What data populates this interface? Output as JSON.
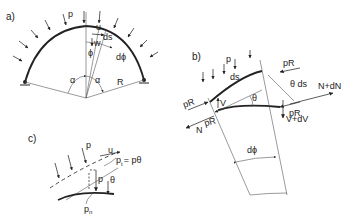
{
  "figure": {
    "panel_a": {
      "label": "a)",
      "load": "p",
      "tangential_disp": "u",
      "radial_disp": "w",
      "element": "ds",
      "angle_phi": "ϕ",
      "angle_dphi": "dϕ",
      "half_angle_left": "α",
      "half_angle_right": "α",
      "radius": "R"
    },
    "panel_b": {
      "label": "b)",
      "load": "p",
      "element": "ds",
      "force_pR_top_right": "pR",
      "force_pR_left_upper": "pR",
      "force_pR_left_lower": "pR",
      "force_pR_right": "pR",
      "theta_ds": "θ ds",
      "theta": "θ",
      "shear_left": "V",
      "normal_left": "N",
      "normal_right": "N+dN",
      "shear_right": "V+dV",
      "angle_dphi": "dϕ"
    },
    "panel_c": {
      "label": "c)",
      "load_top": "p",
      "tangential_disp": "u",
      "pt_main": "p",
      "pt_sub": "t",
      "pt_rhs": "= pθ",
      "load_mid": "p",
      "theta": "θ",
      "pn_main": "p",
      "pn_sub": "n"
    }
  }
}
